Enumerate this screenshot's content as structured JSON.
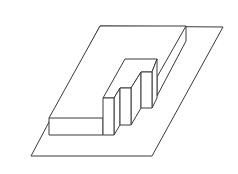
{
  "diagram": {
    "title": "Isometric stepped solid on a parallelogram base plane",
    "stroke_color": "#3a3a3a",
    "background": "#ffffff",
    "plane": {
      "label": "base-plane",
      "points": [
        [
          100,
          26
        ],
        [
          223,
          27
        ],
        [
          152,
          156
        ],
        [
          31,
          156
        ]
      ]
    },
    "slab": {
      "label": "L-shaped slab",
      "front_face": [
        [
          49,
          118
        ],
        [
          103,
          118
        ],
        [
          103,
          135
        ],
        [
          49,
          135
        ]
      ],
      "top_edge": [
        [
          100,
          26
        ],
        [
          186,
          26
        ]
      ],
      "right_vertical": [
        [
          186,
          26
        ],
        [
          186,
          41
        ]
      ],
      "right_upper_diagonal": [
        [
          186,
          26
        ],
        [
          157,
          77
        ]
      ],
      "right_lower_diagonal": [
        [
          186,
          41
        ],
        [
          157,
          96
        ]
      ]
    },
    "plateau": {
      "label": "raised plateau",
      "back_edge": [
        [
          125,
          59
        ],
        [
          157,
          59
        ]
      ],
      "left_edge": [
        [
          125,
          59
        ],
        [
          103,
          98
        ]
      ],
      "right_vertical": [
        [
          157,
          59
        ],
        [
          157,
          98
        ]
      ]
    },
    "pillars": [
      {
        "label": "step-1",
        "front": [
          [
            103,
            98
          ],
          [
            114,
            98
          ],
          [
            114,
            135
          ],
          [
            103,
            135
          ]
        ],
        "side_top": [
          [
            114,
            98
          ],
          [
            120,
            88
          ]
        ],
        "side_bottom": [
          [
            114,
            135
          ],
          [
            120,
            125
          ]
        ]
      },
      {
        "label": "step-2",
        "front": [
          [
            120,
            88
          ],
          [
            131,
            88
          ],
          [
            131,
            125
          ],
          [
            120,
            125
          ]
        ],
        "side_top": [
          [
            131,
            88
          ],
          [
            141,
            72
          ]
        ],
        "side_bottom": [
          [
            131,
            125
          ],
          [
            141,
            108
          ]
        ]
      },
      {
        "label": "step-3",
        "front": [
          [
            141,
            72
          ],
          [
            152,
            72
          ],
          [
            152,
            108
          ],
          [
            141,
            108
          ]
        ],
        "side_top": [
          [
            152,
            72
          ],
          [
            157,
            59
          ]
        ],
        "side_bottom": [
          [
            152,
            108
          ],
          [
            157,
            98
          ]
        ]
      }
    ]
  }
}
